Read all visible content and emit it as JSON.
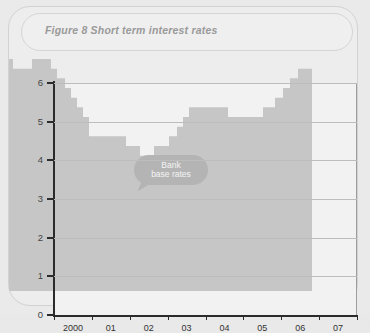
{
  "card": {
    "title": "Figure 8  Short term interest rates"
  },
  "callout": {
    "line1": "Bank",
    "line2": "base rates"
  },
  "colors": {
    "series_fill": "#c6c6c6",
    "plot_background": "#f2f2f2",
    "gridline": "#bdbdbd",
    "axis": "#2b2b2b",
    "callout_background": "#b4b4b4",
    "title_text": "#9a9a9a"
  },
  "chart_data": {
    "type": "area",
    "title": "Figure 8  Short term interest rates",
    "subtitle": "",
    "xlabel": "",
    "ylabel": "%",
    "ylim": [
      0,
      6
    ],
    "yticks": [
      0,
      1,
      2,
      3,
      4,
      5,
      6
    ],
    "ytick_labels": [
      "0",
      "1",
      "2",
      "3",
      "4",
      "5",
      "6"
    ],
    "xlim": [
      2000,
      2007.75
    ],
    "xtick_labels": [
      "2000",
      "01",
      "02",
      "03",
      "04",
      "05",
      "06",
      "07"
    ],
    "grid": true,
    "legend": "none",
    "annotations": [
      {
        "text": "Bank base rates",
        "x": 2002.0,
        "y": 5.0
      }
    ],
    "series": [
      {
        "name": "Bank base rates",
        "step": "post",
        "x": [
          2000.0,
          2000.1,
          2000.6,
          2001.1,
          2001.25,
          2001.45,
          2001.6,
          2001.75,
          2001.85,
          2002.0,
          2002.1,
          2003.0,
          2003.3,
          2003.5,
          2003.8,
          2003.95,
          2004.15,
          2004.3,
          2004.45,
          2004.6,
          2005.6,
          2005.75,
          2006.6,
          2006.85,
          2007.0,
          2007.25,
          2007.45,
          2007.6,
          2007.75
        ],
        "y": [
          6.0,
          5.75,
          6.0,
          5.75,
          5.5,
          5.25,
          5.0,
          4.75,
          4.5,
          4.0,
          4.0,
          3.75,
          3.5,
          3.75,
          3.75,
          4.0,
          4.25,
          4.5,
          4.75,
          4.75,
          4.5,
          4.5,
          4.75,
          5.0,
          5.25,
          5.25,
          5.5,
          5.75,
          5.75
        ]
      }
    ]
  }
}
